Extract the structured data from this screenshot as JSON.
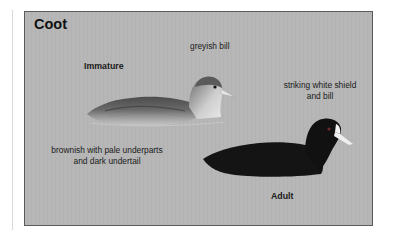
{
  "figure": {
    "title": "Coot",
    "immature": {
      "label": "Immature",
      "bill_note": "greyish bill",
      "plumage_note_line1": "brownish with pale underparts",
      "plumage_note_line2": "and dark undertail"
    },
    "adult": {
      "label": "Adult",
      "shield_note_line1": "striking white shield",
      "shield_note_line2": "and bill"
    }
  },
  "colors": {
    "panel_bg": "#b6b6b6",
    "panel_border": "#5a5a5a",
    "text": "#1a1a1a",
    "adult_body": "#141414",
    "adult_shield": "#f2f2f2",
    "immature_body": "#5e5e5e",
    "immature_underparts": "#d4d4d4"
  }
}
